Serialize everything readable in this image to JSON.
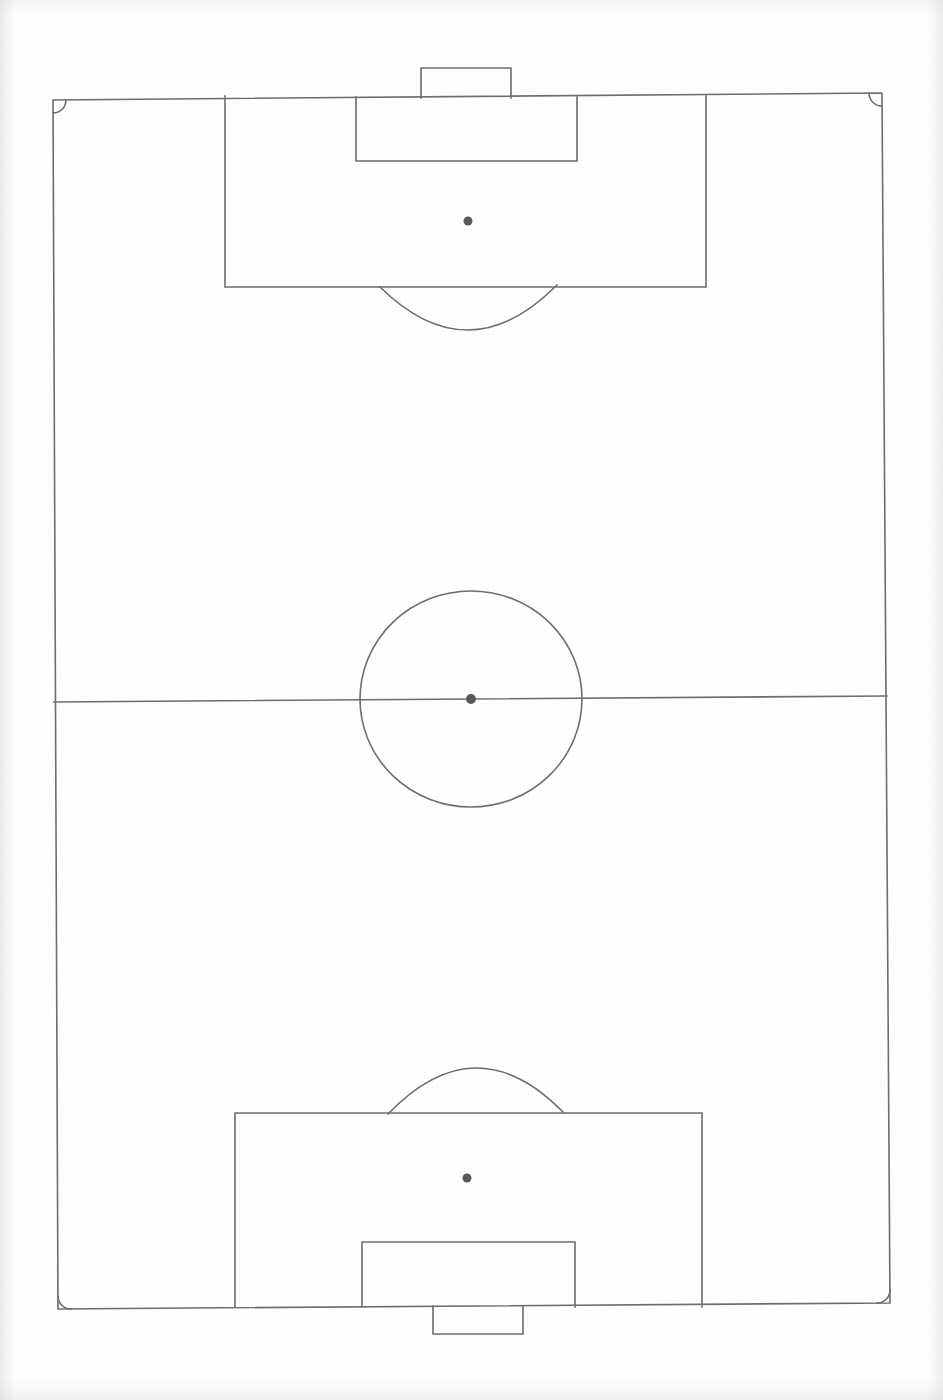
{
  "document": {
    "type": "soccer-pitch-diagram",
    "title": "Soccer Field Diagram",
    "orientation": "portrait",
    "background_color": "#ffffff",
    "line_color": "#6e6e72",
    "spot_color": "#5a5a5e",
    "line_width": 1.6,
    "canvas": {
      "width": 943,
      "height": 1400
    }
  },
  "chart_data": {
    "type": "diagram",
    "title": "Soccer Field Diagram",
    "xlabel": "",
    "ylabel": "",
    "features": [
      {
        "name": "field-boundary",
        "label": "Touchlines and goal lines",
        "points": [
          [
            53,
            100
          ],
          [
            882,
            93
          ],
          [
            890,
            1303
          ],
          [
            58,
            1309
          ]
        ]
      },
      {
        "name": "halfway-line",
        "label": "Halfway line",
        "points": [
          [
            54,
            702
          ],
          [
            887,
            696
          ]
        ]
      },
      {
        "name": "center-circle",
        "label": "Center circle",
        "cx": 471,
        "cy": 699,
        "rx": 111,
        "ry": 108
      },
      {
        "name": "center-spot",
        "label": "Center spot",
        "cx": 471,
        "cy": 699,
        "r": 5
      },
      {
        "name": "top-penalty-area",
        "label": "Top penalty area",
        "x": 225,
        "y": 96,
        "width": 481,
        "height": 191
      },
      {
        "name": "top-goal-area",
        "label": "Top goal area",
        "x": 356,
        "y": 97,
        "width": 221,
        "height": 64
      },
      {
        "name": "top-goal",
        "label": "Top goal",
        "x": 421,
        "y": 68,
        "width": 90,
        "height": 30
      },
      {
        "name": "top-penalty-spot",
        "label": "Top penalty spot",
        "cx": 468,
        "cy": 221,
        "r": 4.5
      },
      {
        "name": "top-penalty-arc",
        "label": "Top penalty arc (D)",
        "start": [
          380,
          287
        ],
        "end": [
          557,
          285
        ],
        "depth": 44
      },
      {
        "name": "bottom-penalty-area",
        "label": "Bottom penalty area",
        "x": 235,
        "y": 1113,
        "width": 467,
        "height": 194
      },
      {
        "name": "bottom-goal-area",
        "label": "Bottom goal area",
        "x": 362,
        "y": 1242,
        "width": 213,
        "height": 65
      },
      {
        "name": "bottom-goal",
        "label": "Bottom goal",
        "x": 433,
        "y": 1306,
        "width": 90,
        "height": 28
      },
      {
        "name": "bottom-penalty-spot",
        "label": "Bottom penalty spot",
        "cx": 467,
        "cy": 1178,
        "r": 4.5
      },
      {
        "name": "bottom-penalty-arc",
        "label": "Bottom penalty arc (D)",
        "start": [
          388,
          1114
        ],
        "end": [
          563,
          1112
        ],
        "depth": 45
      },
      {
        "name": "corner-arc-top-left",
        "label": "Corner arc top-left",
        "cx": 53,
        "cy": 100,
        "r": 13
      },
      {
        "name": "corner-arc-top-right",
        "label": "Corner arc top-right",
        "cx": 882,
        "cy": 93,
        "r": 13
      },
      {
        "name": "corner-arc-bottom-left",
        "label": "Corner arc bottom-left",
        "cx": 58,
        "cy": 1309,
        "r": 13
      },
      {
        "name": "corner-arc-bottom-right",
        "label": "Corner arc bottom-right",
        "cx": 890,
        "cy": 1303,
        "r": 13
      }
    ]
  }
}
